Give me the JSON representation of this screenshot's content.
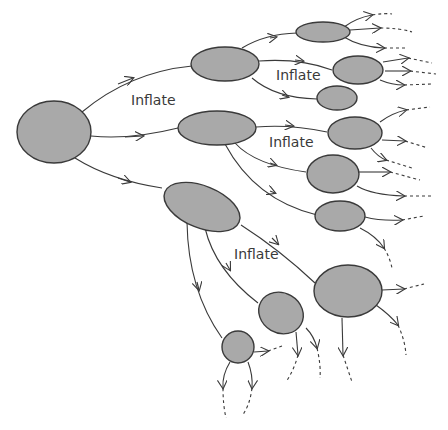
{
  "diagram": {
    "type": "branching-tree",
    "labels": [
      {
        "id": "label1",
        "text": "Inflate",
        "x": 131,
        "y": 92
      },
      {
        "id": "label2",
        "text": "Inflate",
        "x": 276,
        "y": 67
      },
      {
        "id": "label3",
        "text": "Inflate",
        "x": 269,
        "y": 134
      },
      {
        "id": "label4",
        "text": "Inflate",
        "x": 234,
        "y": 246
      }
    ],
    "colors": {
      "node_fill": "#a9a9a9",
      "stroke": "#3a3a3a",
      "background": "#ffffff"
    }
  }
}
